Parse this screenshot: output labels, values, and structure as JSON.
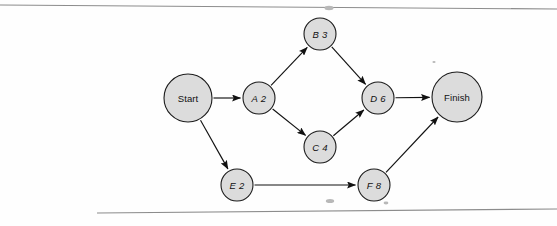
{
  "figure": {
    "type": "activity-on-node network",
    "background_color": "#fefefe",
    "node_fill_color": "#dcdcdc",
    "node_stroke_color": "#1c1c1c",
    "edge_color": "#111111",
    "rule_color": "#8c8c8c"
  },
  "nodes": [
    {
      "id": "start",
      "label": "Start",
      "activity": "",
      "duration": "",
      "kind": "terminal",
      "cx": 188,
      "cy": 98,
      "r": 24
    },
    {
      "id": "a",
      "label": "A 2",
      "activity": "A",
      "duration": "2",
      "kind": "activity",
      "cx": 259,
      "cy": 98,
      "r": 16
    },
    {
      "id": "b",
      "label": "B 3",
      "activity": "B",
      "duration": "3",
      "kind": "activity",
      "cx": 320,
      "cy": 34,
      "r": 16
    },
    {
      "id": "c",
      "label": "C 4",
      "activity": "C",
      "duration": "4",
      "kind": "activity",
      "cx": 320,
      "cy": 147,
      "r": 16
    },
    {
      "id": "d",
      "label": "D 6",
      "activity": "D",
      "duration": "6",
      "kind": "activity",
      "cx": 378,
      "cy": 98,
      "r": 16
    },
    {
      "id": "e",
      "label": "E 2",
      "activity": "E",
      "duration": "2",
      "kind": "activity",
      "cx": 237,
      "cy": 185,
      "r": 16
    },
    {
      "id": "f",
      "label": "F 8",
      "activity": "F",
      "duration": "8",
      "kind": "activity",
      "cx": 374,
      "cy": 185,
      "r": 16
    },
    {
      "id": "finish",
      "label": "Finish",
      "activity": "",
      "duration": "",
      "kind": "terminal",
      "cx": 457,
      "cy": 97,
      "r": 25
    }
  ],
  "edges": [
    {
      "id": "start-a",
      "from": "start",
      "to": "a",
      "label": ""
    },
    {
      "id": "start-e",
      "from": "start",
      "to": "e",
      "label": ""
    },
    {
      "id": "a-b",
      "from": "a",
      "to": "b",
      "label": ""
    },
    {
      "id": "a-c",
      "from": "a",
      "to": "c",
      "label": ""
    },
    {
      "id": "b-d",
      "from": "b",
      "to": "d",
      "label": ""
    },
    {
      "id": "c-d",
      "from": "c",
      "to": "d",
      "label": ""
    },
    {
      "id": "d-finish",
      "from": "d",
      "to": "finish",
      "label": ""
    },
    {
      "id": "e-f",
      "from": "e",
      "to": "f",
      "label": ""
    },
    {
      "id": "f-finish",
      "from": "f",
      "to": "finish",
      "label": ""
    }
  ],
  "rules": [
    {
      "id": "top-rule",
      "x1": 0,
      "y1": 5,
      "x2": 557,
      "y2": 9
    },
    {
      "id": "bottom-rule",
      "x1": 97,
      "y1": 213,
      "x2": 557,
      "y2": 209
    }
  ]
}
